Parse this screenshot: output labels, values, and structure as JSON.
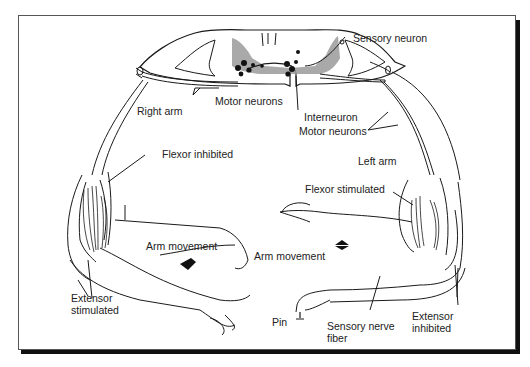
{
  "figure": {
    "colors": {
      "line": "#1a1a1a",
      "gray_matter": "#9a9a9a",
      "frame_shadow": "#111111"
    }
  },
  "labels": {
    "sensory_neuron": "Sensory neuron",
    "motor_neurons_left": "Motor neurons",
    "interneuron": "Interneuron",
    "motor_neurons_right": "Motor neurons",
    "right_arm": "Right arm",
    "left_arm": "Left arm",
    "flexor_inhibited": "Flexor inhibited",
    "flexor_stimulated": "Flexor stimulated",
    "arm_movement_left": "Arm movement",
    "arm_movement_right": "Arm movement",
    "extensor_stimulated": "Extensor stimulated",
    "extensor_inhibited": "Extensor inhibited",
    "pin": "Pin",
    "sensory_nerve_fiber": "Sensory nerve fiber"
  }
}
